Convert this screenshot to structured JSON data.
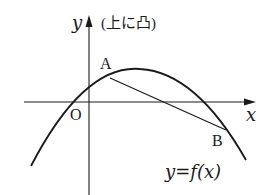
{
  "diagram": {
    "title_note": "(上に凸)",
    "axes": {
      "x_label": "x",
      "y_label": "y",
      "origin_label": "O"
    },
    "points": [
      {
        "name": "A",
        "label": "A"
      },
      {
        "name": "B",
        "label": "B"
      }
    ],
    "curve_label": "y=f(x)",
    "colors": {
      "stroke": "#1a1a1a",
      "background": "#ffffff"
    }
  }
}
